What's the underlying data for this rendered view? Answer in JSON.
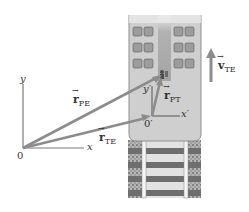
{
  "figure": {
    "colors": {
      "vector": "#8c8c8c",
      "axes": "#7a7a7a",
      "car_floor": "#cfcfcf",
      "car_aisle": "#a9a9a9",
      "track_ties": "#6e6e6e",
      "ballast": "#9a9a9a",
      "rails": "#f2f2f2"
    }
  },
  "ground_frame": {
    "origin_label": "0",
    "x_label": "x",
    "y_label": "y"
  },
  "train_frame": {
    "origin_label": "0′",
    "x_label": "x′",
    "y_label": "y′"
  },
  "vectors": {
    "r_PE": {
      "symbol": "r",
      "subscript": "PE"
    },
    "r_TE": {
      "symbol": "r",
      "subscript": "TE"
    },
    "r_PT": {
      "symbol": "r",
      "subscript": "PT"
    },
    "v_TE": {
      "symbol": "v",
      "subscript": "TE"
    }
  }
}
